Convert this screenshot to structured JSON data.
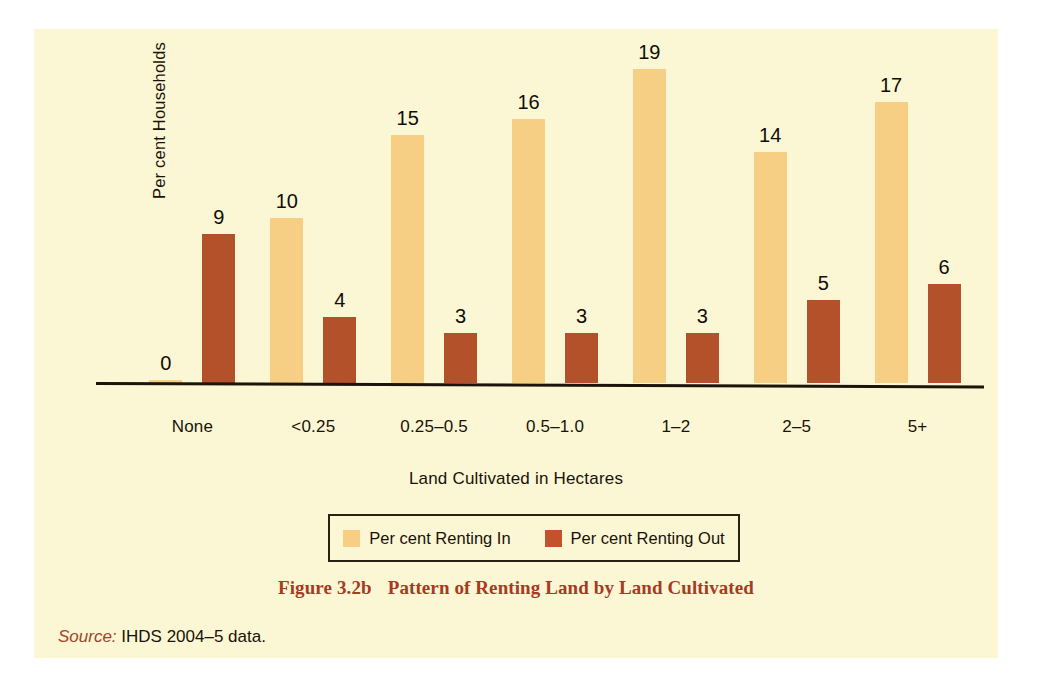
{
  "figure": {
    "caption_number": "Figure 3.2b",
    "caption_text": "Pattern of Renting Land by Land Cultivated",
    "source_label": "Source:",
    "source_text": "IHDS 2004–5 data."
  },
  "legend": {
    "entries": [
      {
        "label": "Per cent Renting In",
        "swatch": "legend-swatch-renting-in"
      },
      {
        "label": "Per cent Renting Out",
        "swatch": "legend-swatch-renting-out"
      }
    ]
  },
  "colors": {
    "panel_background": "#fbf7d5",
    "series_in": "#f7cf84",
    "series_out": "#b3512a",
    "axis": "#1b140a",
    "caption": "#a73a22",
    "text": "#1a1208"
  },
  "chart_data": {
    "type": "bar",
    "title": "Pattern of Renting Land by Land Cultivated",
    "xlabel": "Land Cultivated in Hectares",
    "ylabel": "Per cent Households",
    "categories": [
      "None",
      "<0.25",
      "0.25–0.5",
      "0.5–1.0",
      "1–2",
      "2–5",
      "5+"
    ],
    "series": [
      {
        "name": "Per cent Renting In",
        "values": [
          0,
          10,
          15,
          16,
          19,
          14,
          17
        ]
      },
      {
        "name": "Per cent Renting Out",
        "values": [
          9,
          4,
          3,
          3,
          3,
          5,
          6
        ]
      }
    ],
    "ylim": [
      0,
      19
    ],
    "grid": false,
    "legend_position": "bottom",
    "data_labels": true
  }
}
